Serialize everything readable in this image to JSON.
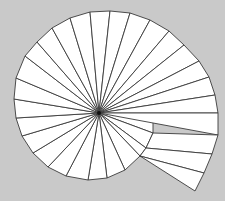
{
  "diagram": {
    "type": "spiral-fan",
    "background_color": "#c9c9c9",
    "fill_color": "#ffffff",
    "stroke_color": "#3a3a3a",
    "center": [
      99,
      113
    ],
    "boundary_vertices": [
      [
        80,
        108
      ],
      [
        80,
        94
      ],
      [
        97,
        77
      ],
      [
        116,
        75
      ],
      [
        136,
        82
      ],
      [
        147,
        101
      ],
      [
        153,
        117
      ],
      [
        153,
        133
      ],
      [
        146,
        148
      ],
      [
        140,
        156
      ],
      [
        125,
        170
      ],
      [
        107,
        178
      ],
      [
        88,
        180
      ],
      [
        66,
        176
      ],
      [
        48,
        167
      ],
      [
        33,
        153
      ],
      [
        22,
        136
      ],
      [
        16,
        118
      ],
      [
        14,
        99
      ],
      [
        16,
        78
      ],
      [
        25,
        56
      ],
      [
        37,
        42
      ],
      [
        52,
        28
      ],
      [
        70,
        18
      ],
      [
        90,
        12
      ],
      [
        110,
        11
      ],
      [
        130,
        13
      ],
      [
        150,
        20
      ],
      [
        169,
        31
      ],
      [
        184,
        45
      ],
      [
        199,
        61
      ],
      [
        209,
        77
      ],
      [
        215,
        95
      ],
      [
        218,
        113
      ],
      [
        218,
        135
      ],
      [
        212,
        154
      ],
      [
        204,
        173
      ],
      [
        195,
        191
      ]
    ],
    "tail_inner_vertices": [
      [
        153,
        133
      ],
      [
        146,
        148
      ],
      [
        140,
        156
      ]
    ],
    "triangle_count": 37
  }
}
